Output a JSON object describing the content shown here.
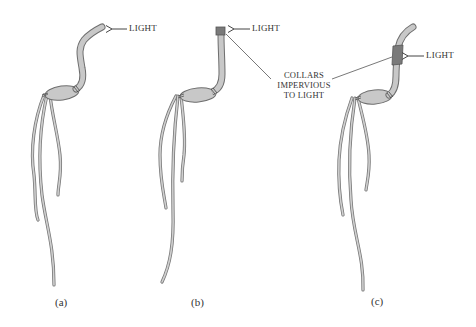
{
  "figure": {
    "colors": {
      "plant_fill": "#c8c8c8",
      "plant_stroke": "#6e6e6e",
      "collar_fill": "#7a7a7a",
      "text": "#333333",
      "background": "#ffffff"
    },
    "panels": [
      {
        "id": "a",
        "label": "(a)",
        "light_label": "LIGHT",
        "description": "Intact seedling bends toward light"
      },
      {
        "id": "b",
        "label": "(b)",
        "light_label": "LIGHT",
        "description": "Tip covered by opaque collar; no bending"
      },
      {
        "id": "c",
        "label": "(c)",
        "light_label": "LIGHT",
        "description": "Collar below tip; seedling bends toward light"
      }
    ],
    "annotation": {
      "line1": "COLLARS",
      "line2": "IMPERVIOUS",
      "line3": "TO LIGHT"
    }
  }
}
